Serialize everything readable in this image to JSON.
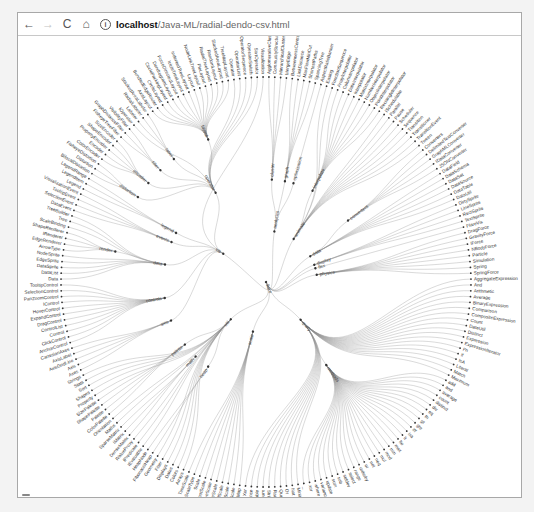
{
  "browser": {
    "back_icon": "←",
    "forward_icon": "→",
    "reload_icon": "C",
    "home_icon": "⌂",
    "info_icon": "i",
    "url_host": "localhost",
    "url_path": "/Java-ML/radial-dendo-csv.html"
  },
  "chart": {
    "type": "radial-dendrogram",
    "center": [
      265,
      281
    ],
    "radius": 205,
    "link_color": "#8c8c8c",
    "node_color": "#333333",
    "root": {
      "name": "flare",
      "children": [
        {
          "name": "analytics",
          "children": [
            {
              "name": "cluster",
              "children": [
                {
                  "name": "AgglomerativeCluster"
                },
                {
                  "name": "CommunityStructure"
                },
                {
                  "name": "HierarchicalCluster"
                },
                {
                  "name": "MergeEdge"
                }
              ]
            },
            {
              "name": "graph",
              "children": [
                {
                  "name": "BetweennessCentrality"
                },
                {
                  "name": "LinkDistance"
                },
                {
                  "name": "MaxFlowMinCut"
                },
                {
                  "name": "ShortestPaths"
                },
                {
                  "name": "SpanningTree"
                }
              ]
            },
            {
              "name": "optimization",
              "children": [
                {
                  "name": "AspectRatioBanker"
                }
              ]
            }
          ]
        },
        {
          "name": "animate",
          "children": [
            {
              "name": "Easing"
            },
            {
              "name": "FunctionSequence"
            },
            {
              "name": "interpolate",
              "children": [
                {
                  "name": "ArrayInterpolator"
                },
                {
                  "name": "ColorInterpolator"
                },
                {
                  "name": "DateInterpolator"
                },
                {
                  "name": "Interpolator"
                },
                {
                  "name": "MatrixInterpolator"
                },
                {
                  "name": "NumberInterpolator"
                },
                {
                  "name": "ObjectInterpolator"
                },
                {
                  "name": "PointInterpolator"
                },
                {
                  "name": "RectangleInterpolator"
                }
              ]
            },
            {
              "name": "ISchedulable"
            },
            {
              "name": "Parallel"
            },
            {
              "name": "Pause"
            },
            {
              "name": "Scheduler"
            },
            {
              "name": "Sequence"
            },
            {
              "name": "Transition"
            },
            {
              "name": "Transitioner"
            },
            {
              "name": "TransitionEvent"
            },
            {
              "name": "Tween"
            }
          ]
        },
        {
          "name": "data",
          "children": [
            {
              "name": "converters",
              "children": [
                {
                  "name": "Converters"
                },
                {
                  "name": "DelimitedTextConverter"
                },
                {
                  "name": "GraphMLConverter"
                },
                {
                  "name": "IDataConverter"
                },
                {
                  "name": "JSONConverter"
                }
              ]
            },
            {
              "name": "DataField"
            },
            {
              "name": "DataSchema"
            },
            {
              "name": "DataSet"
            },
            {
              "name": "DataSource"
            },
            {
              "name": "DataTable"
            },
            {
              "name": "DataUtil"
            }
          ]
        },
        {
          "name": "display",
          "children": [
            {
              "name": "DirtySprite"
            },
            {
              "name": "LineSprite"
            },
            {
              "name": "RectSprite"
            },
            {
              "name": "TextSprite"
            }
          ]
        },
        {
          "name": "flex",
          "children": [
            {
              "name": "FlareVis"
            }
          ]
        },
        {
          "name": "physics",
          "children": [
            {
              "name": "DragForce"
            },
            {
              "name": "GravityForce"
            },
            {
              "name": "IForce"
            },
            {
              "name": "NBodyForce"
            },
            {
              "name": "Particle"
            },
            {
              "name": "Simulation"
            },
            {
              "name": "Spring"
            },
            {
              "name": "SpringForce"
            }
          ]
        },
        {
          "name": "query",
          "children": [
            {
              "name": "AggregateExpression"
            },
            {
              "name": "And"
            },
            {
              "name": "Arithmetic"
            },
            {
              "name": "Average"
            },
            {
              "name": "BinaryExpression"
            },
            {
              "name": "Comparison"
            },
            {
              "name": "CompositeExpression"
            },
            {
              "name": "Count"
            },
            {
              "name": "DateUtil"
            },
            {
              "name": "Distinct"
            },
            {
              "name": "Expression"
            },
            {
              "name": "ExpressionIterator"
            },
            {
              "name": "Fn"
            },
            {
              "name": "If"
            },
            {
              "name": "IsA"
            },
            {
              "name": "Literal"
            },
            {
              "name": "Match"
            },
            {
              "name": "Maximum"
            },
            {
              "name": "methods",
              "children": [
                {
                  "name": "add"
                },
                {
                  "name": "and"
                },
                {
                  "name": "average"
                },
                {
                  "name": "count"
                },
                {
                  "name": "distinct"
                },
                {
                  "name": "div"
                },
                {
                  "name": "eq"
                },
                {
                  "name": "fn"
                },
                {
                  "name": "gt"
                },
                {
                  "name": "gte"
                },
                {
                  "name": "iff"
                },
                {
                  "name": "isa"
                },
                {
                  "name": "lt"
                },
                {
                  "name": "lte"
                },
                {
                  "name": "max"
                },
                {
                  "name": "min"
                },
                {
                  "name": "mod"
                },
                {
                  "name": "mul"
                },
                {
                  "name": "neq"
                },
                {
                  "name": "not"
                },
                {
                  "name": "or"
                },
                {
                  "name": "orderby"
                },
                {
                  "name": "range"
                },
                {
                  "name": "select"
                },
                {
                  "name": "stddev"
                },
                {
                  "name": "sub"
                },
                {
                  "name": "sum"
                },
                {
                  "name": "update"
                },
                {
                  "name": "variance"
                },
                {
                  "name": "where"
                },
                {
                  "name": "xor"
                },
                {
                  "name": "_"
                }
              ]
            },
            {
              "name": "Minimum"
            },
            {
              "name": "Not"
            },
            {
              "name": "Or"
            },
            {
              "name": "Query"
            },
            {
              "name": "Range"
            },
            {
              "name": "StringUtil"
            },
            {
              "name": "Sum"
            },
            {
              "name": "Variable"
            },
            {
              "name": "Variance"
            },
            {
              "name": "Xor"
            }
          ]
        },
        {
          "name": "scale",
          "children": [
            {
              "name": "IScaleMap"
            },
            {
              "name": "LinearScale"
            },
            {
              "name": "LogScale"
            },
            {
              "name": "OrdinalScale"
            },
            {
              "name": "QuantileScale"
            },
            {
              "name": "QuantitativeScale"
            },
            {
              "name": "RootScale"
            },
            {
              "name": "Scale"
            },
            {
              "name": "ScaleType"
            },
            {
              "name": "TimeScale"
            }
          ]
        },
        {
          "name": "util",
          "children": [
            {
              "name": "Arrays"
            },
            {
              "name": "Colors"
            },
            {
              "name": "Dates"
            },
            {
              "name": "Displays"
            },
            {
              "name": "Filter"
            },
            {
              "name": "Geometry"
            },
            {
              "name": "heap",
              "children": [
                {
                  "name": "FibonacciHeap"
                },
                {
                  "name": "HeapNode"
                }
              ]
            },
            {
              "name": "IEvaluable"
            },
            {
              "name": "IPredicate"
            },
            {
              "name": "IValueProxy"
            },
            {
              "name": "math",
              "children": [
                {
                  "name": "DenseMatrix"
                },
                {
                  "name": "IMatrix"
                },
                {
                  "name": "SparseMatrix"
                }
              ]
            },
            {
              "name": "Maths"
            },
            {
              "name": "Orientation"
            },
            {
              "name": "palette",
              "children": [
                {
                  "name": "ColorPalette"
                },
                {
                  "name": "Palette"
                },
                {
                  "name": "ShapePalette"
                },
                {
                  "name": "SizePalette"
                }
              ]
            },
            {
              "name": "Property"
            },
            {
              "name": "Shapes"
            },
            {
              "name": "Sort"
            },
            {
              "name": "Stats"
            },
            {
              "name": "Strings"
            }
          ]
        },
        {
          "name": "vis",
          "children": [
            {
              "name": "axis",
              "children": [
                {
                  "name": "Axes"
                },
                {
                  "name": "Axis"
                },
                {
                  "name": "AxisGridLine"
                },
                {
                  "name": "AxisLabel"
                },
                {
                  "name": "CartesianAxes"
                }
              ]
            },
            {
              "name": "controls",
              "children": [
                {
                  "name": "AnchorControl"
                },
                {
                  "name": "ClickControl"
                },
                {
                  "name": "Control"
                },
                {
                  "name": "ControlList"
                },
                {
                  "name": "DragControl"
                },
                {
                  "name": "ExpandControl"
                },
                {
                  "name": "HoverControl"
                },
                {
                  "name": "IControl"
                },
                {
                  "name": "PanZoomControl"
                },
                {
                  "name": "SelectionControl"
                },
                {
                  "name": "TooltipControl"
                }
              ]
            },
            {
              "name": "data",
              "children": [
                {
                  "name": "Data"
                },
                {
                  "name": "DataList"
                },
                {
                  "name": "DataSprite"
                },
                {
                  "name": "EdgeSprite"
                },
                {
                  "name": "NodeSprite"
                },
                {
                  "name": "render",
                  "children": [
                    {
                      "name": "ArrowType"
                    },
                    {
                      "name": "EdgeRenderer"
                    },
                    {
                      "name": "IRenderer"
                    },
                    {
                      "name": "ShapeRenderer"
                    }
                  ]
                },
                {
                  "name": "ScaleBinding"
                },
                {
                  "name": "Tree"
                },
                {
                  "name": "TreeBuilder"
                }
              ]
            },
            {
              "name": "events",
              "children": [
                {
                  "name": "DataEvent"
                },
                {
                  "name": "SelectionEvent"
                },
                {
                  "name": "TooltipEvent"
                },
                {
                  "name": "VisualizationEvent"
                }
              ]
            },
            {
              "name": "legend",
              "children": [
                {
                  "name": "Legend"
                },
                {
                  "name": "LegendItem"
                },
                {
                  "name": "LegendRange"
                }
              ]
            },
            {
              "name": "operator",
              "children": [
                {
                  "name": "distortion",
                  "children": [
                    {
                      "name": "BifocalDistortion"
                    },
                    {
                      "name": "Distortion"
                    },
                    {
                      "name": "FisheyeDistortion"
                    }
                  ]
                },
                {
                  "name": "encoder",
                  "children": [
                    {
                      "name": "ColorEncoder"
                    },
                    {
                      "name": "Encoder"
                    },
                    {
                      "name": "PropertyEncoder"
                    },
                    {
                      "name": "ShapeEncoder"
                    },
                    {
                      "name": "SizeEncoder"
                    }
                  ]
                },
                {
                  "name": "filter",
                  "children": [
                    {
                      "name": "FisheyeTreeFilter"
                    },
                    {
                      "name": "GraphDistanceFilter"
                    },
                    {
                      "name": "VisibilityFilter"
                    }
                  ]
                },
                {
                  "name": "IOperator"
                },
                {
                  "name": "label",
                  "children": [
                    {
                      "name": "Labeler"
                    },
                    {
                      "name": "RadialLabeler"
                    },
                    {
                      "name": "StackedAreaLabeler"
                    }
                  ]
                },
                {
                  "name": "layout",
                  "children": [
                    {
                      "name": "AxisLayout"
                    },
                    {
                      "name": "BundledEdgeRouter"
                    },
                    {
                      "name": "CircleLayout"
                    },
                    {
                      "name": "CirclePackingLayout"
                    },
                    {
                      "name": "DendrogramLayout"
                    },
                    {
                      "name": "ForceDirectedLayout"
                    },
                    {
                      "name": "IcicleTreeLayout"
                    },
                    {
                      "name": "IndentedTreeLayout"
                    },
                    {
                      "name": "Layout"
                    },
                    {
                      "name": "NodeLinkTreeLayout"
                    },
                    {
                      "name": "PieLayout"
                    },
                    {
                      "name": "RadialTreeLayout"
                    },
                    {
                      "name": "RandomLayout"
                    },
                    {
                      "name": "StackedAreaLayout"
                    },
                    {
                      "name": "TreeMapLayout"
                    }
                  ]
                },
                {
                  "name": "Operator"
                },
                {
                  "name": "OperatorList"
                },
                {
                  "name": "OperatorSequence"
                },
                {
                  "name": "OperatorSwitch"
                },
                {
                  "name": "SortOperator"
                }
              ]
            },
            {
              "name": "Visualization"
            }
          ]
        }
      ]
    }
  }
}
